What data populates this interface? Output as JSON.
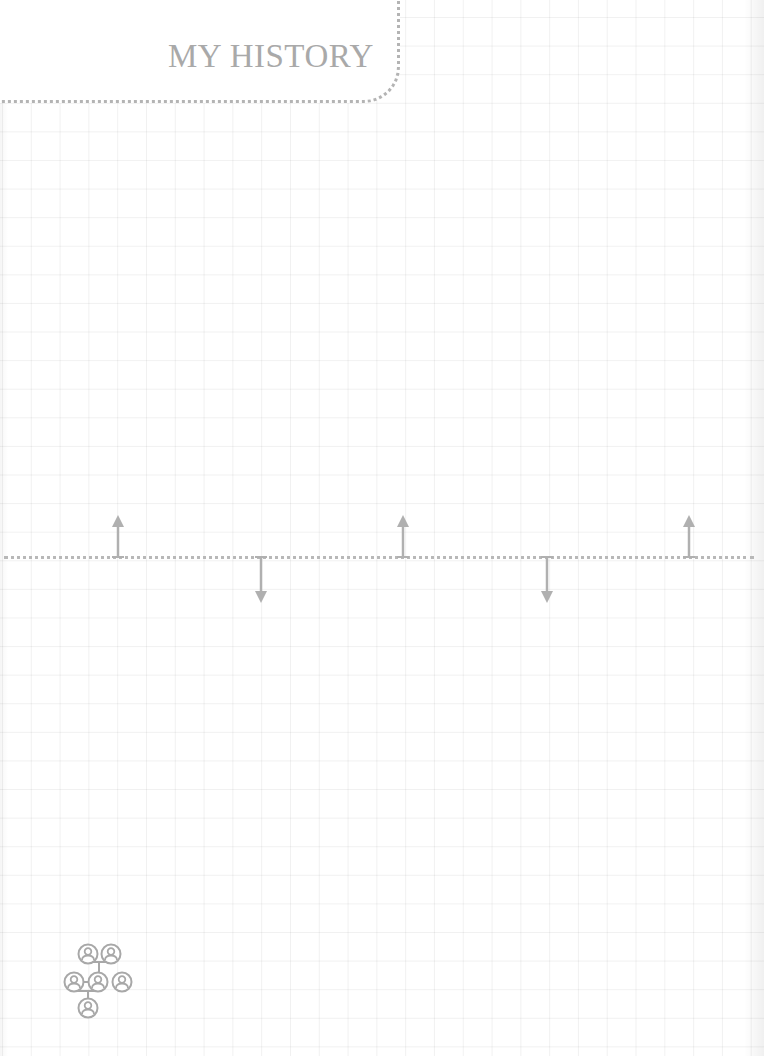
{
  "header": {
    "title": "MY HISTORY"
  },
  "timeline": {
    "line_color": "#b8b8b8",
    "events": [
      {
        "direction": "up",
        "x": 118,
        "icon": "arrow-up-icon"
      },
      {
        "direction": "down",
        "x": 261,
        "icon": "arrow-down-icon"
      },
      {
        "direction": "up",
        "x": 403,
        "icon": "arrow-up-icon"
      },
      {
        "direction": "down",
        "x": 547,
        "icon": "arrow-down-icon"
      },
      {
        "direction": "up",
        "x": 689,
        "icon": "arrow-up-icon"
      }
    ]
  },
  "footer": {
    "icon": "family-tree-icon"
  },
  "colors": {
    "ink": "#a9a9a9",
    "grid": "#ececec",
    "background": "#ffffff"
  }
}
